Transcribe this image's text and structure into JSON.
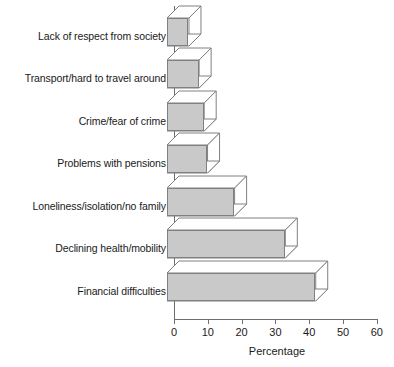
{
  "chart_data": {
    "type": "bar",
    "orientation": "horizontal",
    "title": "",
    "subtitle": "",
    "xlabel": "Percentage",
    "ylabel": "",
    "xlim": [
      0,
      60
    ],
    "xticks": [
      0,
      10,
      20,
      30,
      40,
      50,
      60
    ],
    "xtick_labels": [
      "0",
      "10",
      "20",
      "30",
      "40",
      "50",
      "60"
    ],
    "grid": false,
    "legend": null,
    "style": "3d-bars",
    "categories": [
      "Lack of respect from society",
      "Transport/hard to travel around",
      "Crime/fear of crime",
      "Problems with pensions",
      "Loneliness/isolation/no family",
      "Declining health/mobility",
      "Financial difficulties"
    ],
    "values": [
      6.5,
      9.5,
      11,
      12,
      20,
      35,
      44
    ],
    "series": [
      {
        "name": "Percentage",
        "values": [
          6.5,
          9.5,
          11,
          12,
          20,
          35,
          44
        ]
      }
    ]
  },
  "colors": {
    "bar_fill": "#c9c9c9",
    "bar_outline": "#808080",
    "axis": "#6e6e6e",
    "text": "#1a1a1a",
    "background": "#ffffff",
    "bar_side_face": "#ffffff"
  }
}
